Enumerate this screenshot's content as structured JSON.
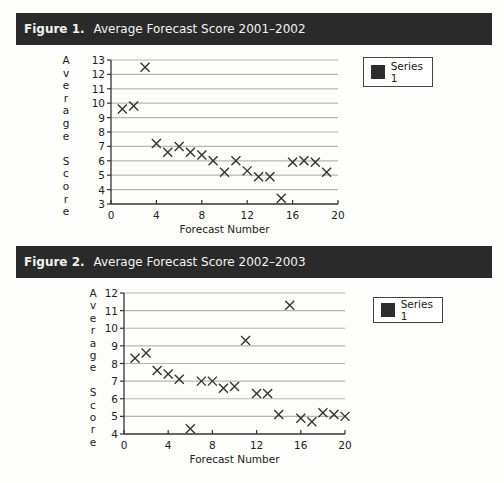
{
  "figures": [
    {
      "label": "Figure 1.",
      "title": "Average Forecast Score 2001–2002",
      "legend": "Series 1"
    },
    {
      "label": "Figure 2.",
      "title": "Average Forecast Score 2002–2003",
      "legend": "Series 1"
    }
  ],
  "colors": {
    "header_bg": "#2a2a2a",
    "marker": "#333333",
    "gridline": "#b5b5b5",
    "legend_swatch": "#2d2d2d"
  },
  "chart_data": [
    {
      "type": "scatter",
      "title": "Average Forecast Score 2001–2002",
      "xlabel": "Forecast Number",
      "ylabel": "Average Score",
      "xlim": [
        0,
        20
      ],
      "ylim": [
        3,
        13
      ],
      "xticks": [
        0,
        4,
        8,
        12,
        16,
        20
      ],
      "yticks": [
        3,
        4,
        5,
        6,
        7,
        8,
        9,
        10,
        11,
        12,
        13
      ],
      "grid": true,
      "legend_position": "right",
      "marker": "x",
      "series": [
        {
          "name": "Series 1",
          "x": [
            1,
            2,
            3,
            4,
            5,
            6,
            7,
            8,
            9,
            10,
            11,
            12,
            13,
            14,
            15,
            16,
            17,
            18,
            19
          ],
          "y": [
            9.6,
            9.8,
            12.5,
            7.2,
            6.6,
            7.0,
            6.6,
            6.4,
            6.0,
            5.2,
            6.0,
            5.3,
            4.9,
            4.9,
            3.4,
            5.9,
            6.0,
            5.9,
            5.2
          ]
        }
      ]
    },
    {
      "type": "scatter",
      "title": "Average Forecast Score 2002–2003",
      "xlabel": "Forecast Number",
      "ylabel": "Average Score",
      "xlim": [
        0,
        20
      ],
      "ylim": [
        4,
        12
      ],
      "xticks": [
        0,
        4,
        8,
        12,
        16,
        20
      ],
      "yticks": [
        4,
        5,
        6,
        7,
        8,
        9,
        10,
        11,
        12
      ],
      "grid": true,
      "legend_position": "right",
      "marker": "x",
      "series": [
        {
          "name": "Series 1",
          "x": [
            1,
            2,
            3,
            4,
            5,
            6,
            7,
            8,
            9,
            10,
            11,
            12,
            13,
            14,
            15,
            16,
            17,
            18,
            19,
            20
          ],
          "y": [
            8.3,
            8.6,
            7.6,
            7.4,
            7.1,
            4.3,
            7.0,
            7.0,
            6.6,
            6.7,
            9.3,
            6.3,
            6.3,
            5.1,
            11.3,
            4.9,
            4.7,
            5.2,
            5.1,
            5.0
          ]
        }
      ]
    }
  ]
}
